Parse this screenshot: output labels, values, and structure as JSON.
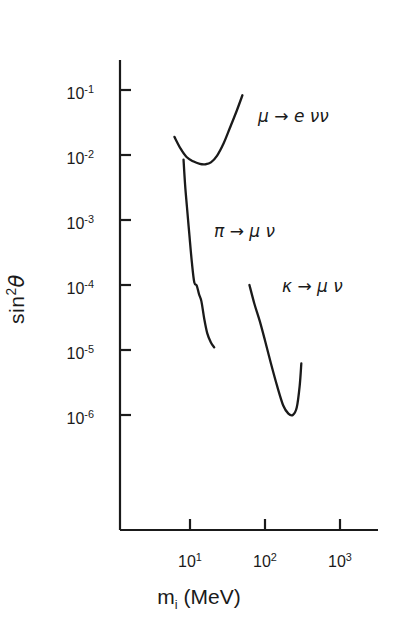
{
  "chart_data": {
    "type": "line",
    "title": "",
    "subtitle": "",
    "xlabel": "m_i (MeV)",
    "ylabel": "sin^2 theta",
    "xscale": "log",
    "yscale": "log",
    "xlim": [
      1,
      3000
    ],
    "ylim": [
      1e-07,
      0.3
    ],
    "grid": false,
    "legend": "none (inline curve annotations)",
    "xticks": [
      {
        "value": 10,
        "label": "10",
        "exponent": "1"
      },
      {
        "value": 100,
        "label": "10",
        "exponent": "2"
      },
      {
        "value": 1000,
        "label": "10",
        "exponent": "3"
      }
    ],
    "yticks": [
      {
        "value": 0.1,
        "label": "10",
        "exponent": "-1"
      },
      {
        "value": 0.01,
        "label": "10",
        "exponent": "-2"
      },
      {
        "value": 0.001,
        "label": "10",
        "exponent": "-3"
      },
      {
        "value": 0.0001,
        "label": "10",
        "exponent": "-4"
      },
      {
        "value": 1e-05,
        "label": "10",
        "exponent": "-5"
      },
      {
        "value": 1e-06,
        "label": "10",
        "exponent": "-6"
      }
    ],
    "series": [
      {
        "name": "mu -> e nu nu",
        "annotation": "μ → e νν",
        "points": [
          {
            "x": 6.2,
            "y": 0.019
          },
          {
            "x": 7.5,
            "y": 0.0125
          },
          {
            "x": 9.0,
            "y": 0.0093
          },
          {
            "x": 11.0,
            "y": 0.008
          },
          {
            "x": 13.5,
            "y": 0.0073
          },
          {
            "x": 16.0,
            "y": 0.0072
          },
          {
            "x": 19.0,
            "y": 0.0077
          },
          {
            "x": 23.0,
            "y": 0.0098
          },
          {
            "x": 28.0,
            "y": 0.015
          },
          {
            "x": 34.0,
            "y": 0.026
          },
          {
            "x": 42.0,
            "y": 0.048
          },
          {
            "x": 50.0,
            "y": 0.083
          }
        ]
      },
      {
        "name": "pi -> mu nu",
        "annotation": "π → μν",
        "points": [
          {
            "x": 8.2,
            "y": 0.0085
          },
          {
            "x": 8.6,
            "y": 0.0035
          },
          {
            "x": 9.1,
            "y": 0.0016
          },
          {
            "x": 9.8,
            "y": 0.0006
          },
          {
            "x": 10.6,
            "y": 0.00022
          },
          {
            "x": 11.4,
            "y": 0.00011
          },
          {
            "x": 12.3,
            "y": 9.8e-05
          },
          {
            "x": 13.2,
            "y": 7.2e-05
          },
          {
            "x": 14.2,
            "y": 5.6e-05
          },
          {
            "x": 15.5,
            "y": 3e-05
          },
          {
            "x": 17.0,
            "y": 1.8e-05
          },
          {
            "x": 19.0,
            "y": 1.3e-05
          },
          {
            "x": 21.0,
            "y": 1.1e-05
          }
        ]
      },
      {
        "name": "kappa -> mu nu",
        "annotation": "κ → μν",
        "points": [
          {
            "x": 62.0,
            "y": 0.0001
          },
          {
            "x": 72.0,
            "y": 5.2e-05
          },
          {
            "x": 85.0,
            "y": 2.8e-05
          },
          {
            "x": 100.0,
            "y": 1.4e-05
          },
          {
            "x": 120.0,
            "y": 6.2e-06
          },
          {
            "x": 145.0,
            "y": 2.8e-06
          },
          {
            "x": 175.0,
            "y": 1.4e-06
          },
          {
            "x": 205.0,
            "y": 1.05e-06
          },
          {
            "x": 235.0,
            "y": 1e-06
          },
          {
            "x": 265.0,
            "y": 1.3e-06
          },
          {
            "x": 290.0,
            "y": 2.8e-06
          },
          {
            "x": 305.0,
            "y": 6.2e-06
          }
        ]
      }
    ]
  },
  "axes": {
    "y_title_base": "sin",
    "y_title_exp": "2",
    "y_title_sym": "θ",
    "x_title_base": "m",
    "x_title_sub": "i",
    "x_title_unit": "(MeV)",
    "ytick_labels": [
      {
        "mantissa": "10",
        "exp": "-1"
      },
      {
        "mantissa": "10",
        "exp": "-2"
      },
      {
        "mantissa": "10",
        "exp": "-3"
      },
      {
        "mantissa": "10",
        "exp": "-4"
      },
      {
        "mantissa": "10",
        "exp": "-5"
      },
      {
        "mantissa": "10",
        "exp": "-6"
      }
    ],
    "xtick_labels": [
      {
        "mantissa": "10",
        "exp": "1"
      },
      {
        "mantissa": "10",
        "exp": "2"
      },
      {
        "mantissa": "10",
        "exp": "3"
      }
    ]
  },
  "annotations": [
    {
      "id": "mu",
      "text": "μ",
      "arrow": "→",
      "products": "e νν"
    },
    {
      "id": "pi",
      "text": "π",
      "arrow": "→",
      "products": "μ ν"
    },
    {
      "id": "kappa",
      "text": "κ",
      "arrow": "→",
      "products": "μ ν"
    }
  ],
  "style": {
    "ink": "#1a1a1a",
    "background": "#ffffff"
  }
}
